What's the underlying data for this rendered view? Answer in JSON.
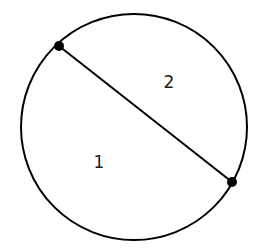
{
  "diagram": {
    "circle": {
      "cx": 134,
      "cy": 127,
      "r": 113,
      "stroke": "#000000"
    },
    "chord": {
      "x1": 59,
      "y1": 46,
      "x2": 232,
      "y2": 182
    },
    "points": [
      {
        "x": 59,
        "y": 46
      },
      {
        "x": 232,
        "y": 182
      }
    ],
    "regions": [
      {
        "label": "1",
        "x": 99,
        "y": 168
      },
      {
        "label": "2",
        "x": 169,
        "y": 88
      }
    ]
  }
}
